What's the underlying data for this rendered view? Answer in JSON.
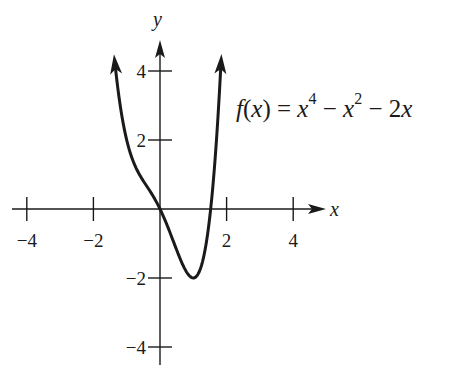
{
  "chart_data": {
    "type": "line",
    "title": "",
    "function_label": {
      "name": "f(x)",
      "expression": "x^4 − x^2 − 2x"
    },
    "xlabel": "x",
    "ylabel": "y",
    "xlim": [
      -4.5,
      5
    ],
    "ylim": [
      -4.5,
      5
    ],
    "x_ticks": [
      -4,
      -2,
      2,
      4
    ],
    "x_tick_labels": [
      "−4",
      "−2",
      "2",
      "4"
    ],
    "y_ticks": [
      4,
      2,
      -2,
      -4
    ],
    "y_tick_labels": [
      "4",
      "2",
      "−2",
      "−4"
    ],
    "grid": false,
    "legend": "none",
    "series": [
      {
        "name": "f(x) = x^4 − x^2 − 2x",
        "x": [
          -1.35,
          -1.2,
          -1.0,
          -0.8,
          -0.6,
          -0.4,
          -0.2,
          0.0,
          0.2,
          0.4,
          0.6,
          0.8,
          1.0,
          1.2,
          1.4,
          1.6,
          1.83
        ],
        "y": [
          4.19,
          3.03,
          2.0,
          1.37,
          0.97,
          0.67,
          0.36,
          0.0,
          -0.44,
          -0.94,
          -1.43,
          -1.83,
          -2.0,
          -1.77,
          -0.92,
          0.79,
          4.19
        ],
        "end_arrows": true
      }
    ]
  },
  "formula": {
    "f": "f",
    "open": "(",
    "x": "x",
    "close": ")",
    "eq": " = ",
    "t1": "x",
    "e1": "4",
    "m1": " − ",
    "t2": "x",
    "e2": "2",
    "m2": " − 2",
    "t3": "x"
  }
}
